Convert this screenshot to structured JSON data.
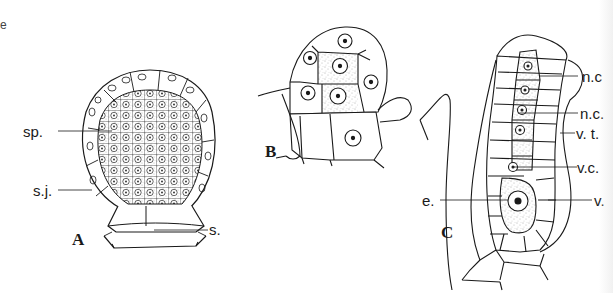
{
  "figure": {
    "panels": [
      {
        "id": "A",
        "letter": "A",
        "description": "Sporangium with sporogenous tissue surrounded by jacket layer on a stalk"
      },
      {
        "id": "B",
        "letter": "B",
        "description": "Young archegonium initial cells"
      },
      {
        "id": "C",
        "letter": "C",
        "description": "Mature archegonium with neck canal cells, venter and egg"
      }
    ],
    "labels": {
      "sp": "sp.",
      "sj": "s.j.",
      "s": "s.",
      "nc1": "n.c",
      "nc2": "n.c.",
      "vt": "v. t.",
      "vc": "v.c.",
      "e": "e.",
      "v": "v."
    },
    "stray_mark": "e",
    "colors": {
      "ink": "#1a1a1a",
      "background": "#ffffff",
      "stipple": "#555555"
    }
  }
}
